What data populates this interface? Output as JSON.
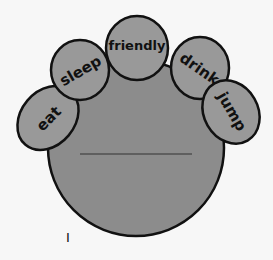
{
  "diagram": {
    "center_blank": "",
    "petals": [
      {
        "label": "eat"
      },
      {
        "label": "sleep"
      },
      {
        "label": "friendly"
      },
      {
        "label": "drink"
      },
      {
        "label": "jump"
      }
    ],
    "bottom_mark": "I"
  },
  "colors": {
    "background": "#f7f7f7",
    "fill": "#8c8c8c",
    "petal_fill": "#999999",
    "stroke": "#111111"
  }
}
